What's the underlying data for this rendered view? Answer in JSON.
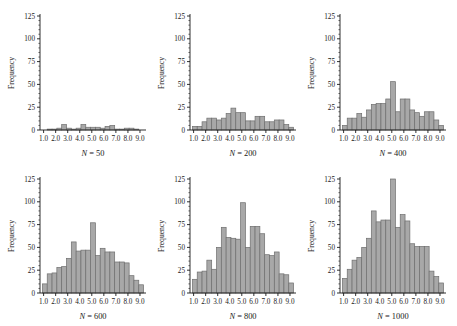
{
  "figure": {
    "type": "histogram-grid",
    "rows": 2,
    "cols": 3,
    "bar_fill": "#a8a8a8",
    "bar_stroke": "#6e6e6e",
    "axis_color": "#1a1a1a",
    "background": "#ffffff"
  },
  "axes": {
    "ylabel": "Frequency",
    "y_ticks": [
      "0",
      "25",
      "50",
      "75",
      "100",
      "125"
    ],
    "y_tick_values": [
      0,
      25,
      50,
      75,
      100,
      125
    ],
    "ylim": [
      0,
      125
    ],
    "x_ticks": [
      "1.0",
      "2.0",
      "3.0",
      "4.0",
      "5.0",
      "6.0",
      "7.0",
      "8.0",
      "9.0"
    ],
    "x_tick_values": [
      1.0,
      2.0,
      3.0,
      4.0,
      5.0,
      6.0,
      7.0,
      8.0,
      9.0
    ],
    "xlim": [
      0.7,
      9.5
    ],
    "grid": false,
    "legend": null
  },
  "chart_data": [
    {
      "type": "bar",
      "id": "panel-n50",
      "title": "N = 50",
      "caption_symbol": "N",
      "caption_value": "50",
      "xlabel": "",
      "ylabel": "Frequency",
      "ylim": [
        0,
        125
      ],
      "xlim": [
        0.7,
        9.5
      ],
      "bin_width": 0.4,
      "bin_starts": [
        0.9,
        1.3,
        1.7,
        2.1,
        2.5,
        2.9,
        3.3,
        3.7,
        4.1,
        4.5,
        4.9,
        5.3,
        5.7,
        6.1,
        6.5,
        6.9,
        7.3,
        7.7,
        8.1,
        8.5,
        8.9
      ],
      "values": [
        0,
        1,
        1,
        2,
        6,
        2,
        1,
        2,
        6,
        3,
        3,
        3,
        2,
        4,
        5,
        1,
        1,
        2,
        2,
        1,
        0
      ]
    },
    {
      "type": "bar",
      "id": "panel-n200",
      "title": "N = 200",
      "caption_symbol": "N",
      "caption_value": "200",
      "xlabel": "",
      "ylabel": "Frequency",
      "ylim": [
        0,
        125
      ],
      "xlim": [
        0.7,
        9.5
      ],
      "bin_width": 0.4,
      "bin_starts": [
        0.9,
        1.3,
        1.7,
        2.1,
        2.5,
        2.9,
        3.3,
        3.7,
        4.1,
        4.5,
        4.9,
        5.3,
        5.7,
        6.1,
        6.5,
        6.9,
        7.3,
        7.7,
        8.1,
        8.5,
        8.9
      ],
      "values": [
        4,
        4,
        9,
        13,
        13,
        11,
        13,
        18,
        24,
        19,
        19,
        10,
        10,
        15,
        15,
        9,
        9,
        11,
        11,
        6,
        3
      ]
    },
    {
      "type": "bar",
      "id": "panel-n400",
      "title": "N = 400",
      "caption_symbol": "N",
      "caption_value": "400",
      "xlabel": "",
      "ylabel": "Frequency",
      "ylim": [
        0,
        125
      ],
      "xlim": [
        0.7,
        9.5
      ],
      "bin_width": 0.4,
      "bin_starts": [
        0.9,
        1.3,
        1.7,
        2.1,
        2.5,
        2.9,
        3.3,
        3.7,
        4.1,
        4.5,
        4.9,
        5.3,
        5.7,
        6.1,
        6.5,
        6.9,
        7.3,
        7.7,
        8.1,
        8.5,
        8.9
      ],
      "values": [
        5,
        13,
        13,
        18,
        14,
        22,
        28,
        29,
        29,
        34,
        53,
        20,
        34,
        34,
        22,
        19,
        15,
        20,
        20,
        11,
        5
      ]
    },
    {
      "type": "bar",
      "id": "panel-n600",
      "title": "N = 600",
      "caption_symbol": "N",
      "caption_value": "600",
      "xlabel": "",
      "ylabel": "Frequency",
      "ylim": [
        0,
        125
      ],
      "xlim": [
        0.7,
        9.5
      ],
      "bin_width": 0.4,
      "bin_starts": [
        0.9,
        1.3,
        1.7,
        2.1,
        2.5,
        2.9,
        3.3,
        3.7,
        4.1,
        4.5,
        4.9,
        5.3,
        5.7,
        6.1,
        6.5,
        6.9,
        7.3,
        7.7,
        8.1,
        8.5,
        8.9
      ],
      "values": [
        10,
        21,
        22,
        28,
        29,
        38,
        56,
        46,
        47,
        47,
        77,
        41,
        49,
        45,
        45,
        34,
        34,
        33,
        19,
        14,
        9
      ]
    },
    {
      "type": "bar",
      "id": "panel-n800",
      "title": "N = 800",
      "caption_symbol": "N",
      "caption_value": "800",
      "xlabel": "",
      "ylabel": "Frequency",
      "ylim": [
        0,
        125
      ],
      "xlim": [
        0.7,
        9.5
      ],
      "bin_width": 0.4,
      "bin_starts": [
        0.9,
        1.3,
        1.7,
        2.1,
        2.5,
        2.9,
        3.3,
        3.7,
        4.1,
        4.5,
        4.9,
        5.3,
        5.7,
        6.1,
        6.5,
        6.9,
        7.3,
        7.7,
        8.1,
        8.5,
        8.9
      ],
      "values": [
        15,
        23,
        24,
        36,
        26,
        50,
        72,
        61,
        60,
        59,
        99,
        50,
        73,
        73,
        65,
        42,
        41,
        45,
        21,
        20,
        11
      ]
    },
    {
      "type": "bar",
      "id": "panel-n1000",
      "title": "N = 1000",
      "caption_symbol": "N",
      "caption_value": "1000",
      "xlabel": "",
      "ylabel": "Frequency",
      "ylim": [
        0,
        125
      ],
      "xlim": [
        0.7,
        9.5
      ],
      "bin_width": 0.4,
      "bin_starts": [
        0.9,
        1.3,
        1.7,
        2.1,
        2.5,
        2.9,
        3.3,
        3.7,
        4.1,
        4.5,
        4.9,
        5.3,
        5.7,
        6.1,
        6.5,
        6.9,
        7.3,
        7.7,
        8.1,
        8.5,
        8.9
      ],
      "values": [
        16,
        26,
        36,
        39,
        50,
        60,
        90,
        78,
        80,
        80,
        125,
        72,
        86,
        79,
        54,
        51,
        51,
        51,
        24,
        18,
        11
      ]
    }
  ]
}
